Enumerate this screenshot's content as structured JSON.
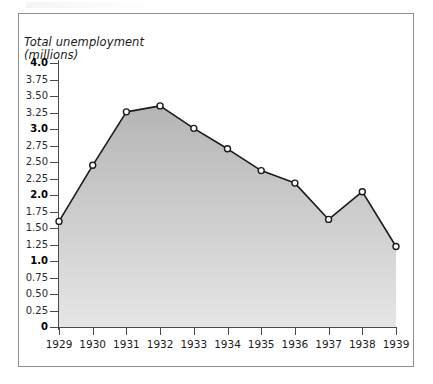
{
  "figure": {
    "title_line1": "Total unemployment",
    "title_line2": "(millions)",
    "frame_color": "#8e8e8e",
    "axis_color": "#4a4a4a",
    "line_color": "#1a1a1a",
    "marker_fill": "#ffffff",
    "area_fill_top": "#b5b5b5",
    "area_fill_bottom": "#e6e6e6"
  },
  "chart_data": {
    "type": "area",
    "title": "Total unemployment (millions)",
    "xlabel": "",
    "ylabel": "Total unemployment (millions)",
    "x": [
      "1929",
      "1930",
      "1931",
      "1932",
      "1933",
      "1934",
      "1935",
      "1936",
      "1937",
      "1938",
      "1939"
    ],
    "values": [
      1.6,
      2.45,
      3.26,
      3.35,
      3.01,
      2.7,
      2.37,
      2.18,
      1.63,
      2.05,
      1.22
    ],
    "ylim": [
      0,
      4.0
    ],
    "ytick_values": [
      4.0,
      3.75,
      3.5,
      3.25,
      3.0,
      2.75,
      2.5,
      2.25,
      2.0,
      1.75,
      1.5,
      1.25,
      1.0,
      0.75,
      0.5,
      0.25,
      0
    ],
    "ytick_labels": [
      "4.0",
      "3.75",
      "3.50",
      "3.25",
      "3.0",
      "2.75",
      "2.50",
      "2.25",
      "2.0",
      "1.75",
      "1.50",
      "1.25",
      "1.0",
      "0.75",
      "0.50",
      "0.25",
      "0"
    ],
    "ytick_bold": [
      true,
      false,
      false,
      false,
      true,
      false,
      false,
      false,
      true,
      false,
      false,
      false,
      true,
      false,
      false,
      false,
      true
    ],
    "grid": false,
    "legend": "none",
    "markers": "open-circle"
  }
}
